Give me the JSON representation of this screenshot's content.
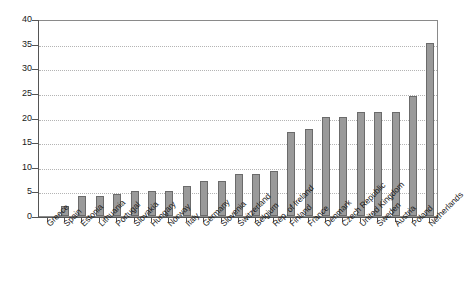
{
  "chart_data": {
    "type": "bar",
    "title": "",
    "subtitle": "",
    "xlabel": "",
    "ylabel": "",
    "ylim": [
      0,
      40
    ],
    "ytick_step": 5,
    "yticks": [
      "0",
      "5",
      "10",
      "15",
      "20",
      "25",
      "30",
      "35",
      "40"
    ],
    "grid": true,
    "legend": false,
    "legend_position": "none",
    "bar_color": "#9a9a9a",
    "bar_border_color": "#6b6b6b",
    "grid_color": "#b4b4b4",
    "axis_color": "#555555",
    "categories": [
      "Greece",
      "Spain",
      "Estonia",
      "Lithuania",
      "Portugal",
      "Slovakia",
      "Hungary",
      "Norway",
      "Italy",
      "Germany",
      "Slovenia",
      "Switzerland",
      "Belgium",
      "Rep. of Ireland",
      "Finland",
      "France",
      "Denmark",
      "Czech Republic",
      "United Kingdom",
      "Sweden",
      "Austria",
      "Poland",
      "Netherlands"
    ],
    "values": [
      0,
      2.1,
      4.1,
      4.1,
      4.4,
      5.1,
      5.1,
      5.1,
      6.1,
      7.1,
      7.1,
      8.6,
      8.6,
      9.2,
      17.1,
      17.6,
      20.2,
      20.2,
      21.2,
      21.2,
      21.2,
      24.3,
      35.2
    ]
  }
}
